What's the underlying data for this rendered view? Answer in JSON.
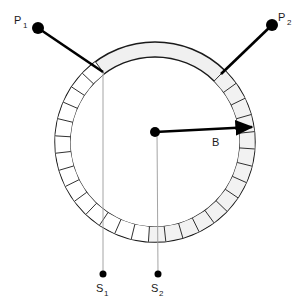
{
  "figure": {
    "title": "",
    "background_color": "#ffffff",
    "width": 298,
    "height": 304
  },
  "colors": {
    "stroke": "#1a1a1a",
    "ring_fill": "#f0f0f0",
    "segment_fill": "#f2f2f2",
    "segment_fill_light": "#ffffff",
    "thin_line": "#9a9a9a",
    "marker_fill": "#000000"
  },
  "ring": {
    "name": "segmented-annulus",
    "center_x": 155,
    "center_y": 142,
    "outer_radius": 100,
    "inner_radius": 85,
    "segment_count": 28,
    "smooth_arc_label": "ungapped top arc between probe contacts"
  },
  "center_marker": {
    "label": "",
    "x": 155,
    "y": 132,
    "radius": 5
  },
  "radius_arrow": {
    "label": "B",
    "from_x": 155,
    "from_y": 132,
    "to_x": 252,
    "to_y": 127,
    "label_x": 212,
    "label_y": 146
  },
  "probes": [
    {
      "label": "P",
      "subscript": "1",
      "dot_x": 38,
      "dot_y": 28,
      "dot_radius": 6,
      "contact_x": 103,
      "contact_y": 72,
      "label_x": 14,
      "label_y": 24,
      "sub_x": 23,
      "sub_y": 28
    },
    {
      "label": "P",
      "subscript": "2",
      "dot_x": 272,
      "dot_y": 25,
      "dot_radius": 6,
      "contact_x": 221,
      "contact_y": 74,
      "label_x": 278,
      "label_y": 21,
      "sub_x": 287,
      "sub_y": 25
    }
  ],
  "drop_lines": [
    {
      "label": "S",
      "subscript": "1",
      "top_x": 103,
      "top_y": 72,
      "bottom_x": 103,
      "bottom_y": 274,
      "dot_radius": 3.5,
      "label_x": 96,
      "label_y": 292,
      "sub_x": 104,
      "sub_y": 296
    },
    {
      "label": "S",
      "subscript": "2",
      "top_x": 157,
      "top_y": 132,
      "bottom_x": 158,
      "bottom_y": 274,
      "dot_radius": 3.5,
      "label_x": 151,
      "label_y": 292,
      "sub_x": 159,
      "sub_y": 296
    }
  ]
}
